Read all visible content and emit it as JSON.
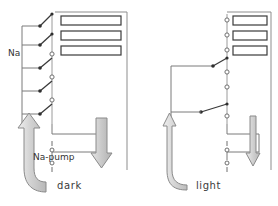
{
  "figure": {
    "panels": [
      {
        "id": "dark",
        "caption": "dark",
        "ion_label": "Na",
        "pump_label": "Na-pump",
        "channel_count": 3,
        "switch_count": 5,
        "switch_states": [
          "closed",
          "closed",
          "open",
          "open",
          "open"
        ],
        "influx_arrow": "thick-up-curved",
        "efflux_arrow": "thick-down",
        "influx_magnitude": "large",
        "efflux_magnitude": "large"
      },
      {
        "id": "light",
        "caption": "light",
        "ion_label": "Na",
        "pump_label": "Na-pump",
        "channel_count": 3,
        "switch_count": 5,
        "switch_states": [
          "open",
          "open",
          "closed",
          "open",
          "closed"
        ],
        "influx_arrow": "thin-up-curved",
        "efflux_arrow": "thin-down",
        "influx_magnitude": "small",
        "efflux_magnitude": "small"
      }
    ],
    "colors": {
      "line": "#6b6b6b",
      "line_dark": "#2f2f2f",
      "arrow_fill": "#cfcfcf",
      "arrow_stroke": "#8a8a8a",
      "text": "#333333",
      "background": "#ffffff"
    }
  }
}
